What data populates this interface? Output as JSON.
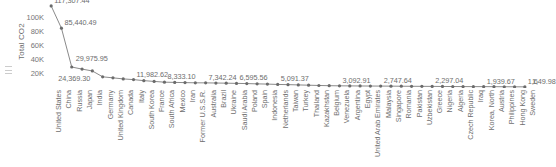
{
  "chart_data": {
    "type": "line",
    "title": "",
    "xlabel": "",
    "ylabel": "Total CO2",
    "ylim": [
      0,
      120000
    ],
    "grid": false,
    "legend": "none",
    "ytick_labels": [
      "20K",
      "40K",
      "60K",
      "80K",
      "100K"
    ],
    "ytick_values": [
      20000,
      40000,
      60000,
      80000,
      100000
    ],
    "categories": [
      "United States",
      "China",
      "Russia",
      "Japan",
      "India",
      "Germany",
      "United Kingdom",
      "Canada",
      "Italy",
      "South Korea",
      "France",
      "South Africa",
      "Mexico",
      "Iran",
      "Former U.S.S.R.",
      "Australia",
      "Brazil",
      "Ukraine",
      "Saudi Arabia",
      "Poland",
      "Spain",
      "Indonesia",
      "Netherlands",
      "Taiwan",
      "Turkey",
      "Thailand",
      "Kazakhstan",
      "Belgium",
      "Venezuela",
      "Argentina",
      "Egypt",
      "United Arab Emirates",
      "Malaysia",
      "Singapore",
      "Romania",
      "Pakistan",
      "Uzbekistan",
      "Greece",
      "Nigeria",
      "Algeria",
      "Czech Republic",
      "Iraq",
      "Korea, North",
      "Austria",
      "Philippines",
      "Hong Kong",
      "Sweden"
    ],
    "values": [
      117307.44,
      85440.49,
      29975.95,
      27000.0,
      24369.3,
      16000.0,
      14500.0,
      13000.0,
      11982.62,
      10500.0,
      9400.0,
      8333.1,
      8000.0,
      7700.0,
      7400.0,
      7342.24,
      7100.0,
      6900.0,
      6595.56,
      6300.0,
      5900.0,
      5600.0,
      5091.37,
      4800.0,
      4400.0,
      4000.0,
      3600.0,
      3300.0,
      3092.91,
      3000.0,
      2900.0,
      2800.0,
      2747.64,
      2650.0,
      2550.0,
      2450.0,
      2380.0,
      2297.04,
      2200.0,
      2100.0,
      2020.0,
      1960.0,
      1939.67,
      1880.0,
      1800.0,
      1720.0,
      1649.98
    ],
    "point_labels": [
      {
        "index": 0,
        "text": "117,307.44"
      },
      {
        "index": 1,
        "text": "85,440.49"
      },
      {
        "index": 2,
        "text": "29,975.95"
      },
      {
        "index": 4,
        "text": "24,369.30"
      },
      {
        "index": 8,
        "text": "11,982.62"
      },
      {
        "index": 11,
        "text": "8,333.10"
      },
      {
        "index": 15,
        "text": "7,342.24"
      },
      {
        "index": 18,
        "text": "6,595.56"
      },
      {
        "index": 22,
        "text": "5,091.37"
      },
      {
        "index": 28,
        "text": "3,092.91"
      },
      {
        "index": 32,
        "text": "2,747.64"
      },
      {
        "index": 37,
        "text": "2,297.04"
      },
      {
        "index": 42,
        "text": "1,939.67"
      },
      {
        "index": 46,
        "text": "1,649.98"
      },
      {
        "index": 50,
        "text": "1,"
      }
    ],
    "colors": {
      "line": "#8a8a8a",
      "marker": "#6b6b6b",
      "text": "#6e6e6e",
      "background": "#ffffff"
    }
  }
}
